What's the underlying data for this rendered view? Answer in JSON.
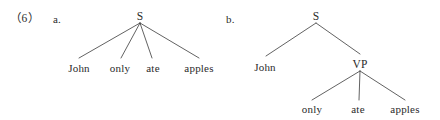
{
  "figure": {
    "example_number": "（6）",
    "stroke_color": "#3a3a3a",
    "text_color": "#2b2b2b",
    "background_color": "#ffffff"
  },
  "trees": [
    {
      "label": "a.",
      "root": "S",
      "leaves": [
        "John",
        "only",
        "ate",
        "apples"
      ],
      "branch_count": 4
    },
    {
      "label": "b.",
      "root": "S",
      "subject": "John",
      "phrase": "VP",
      "leaves": [
        "only",
        "ate",
        "apples"
      ],
      "branch_count": 2
    }
  ]
}
